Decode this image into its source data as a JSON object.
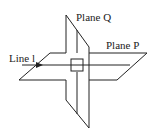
{
  "diagram": {
    "labels": {
      "plane_q": "Plane Q",
      "plane_p": "Plane P",
      "line": "Line l"
    },
    "colors": {
      "stroke": "#222222",
      "background": "#ffffff"
    }
  }
}
